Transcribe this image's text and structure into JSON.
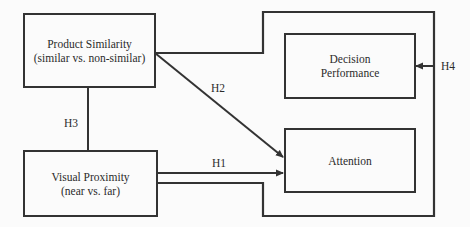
{
  "diagram": {
    "type": "research-model",
    "colors": {
      "line": "#333333",
      "text": "#2b2b2b",
      "background": "#fbfbfb"
    },
    "nodes": {
      "product_similarity": {
        "title": "Product Similarity",
        "subtitle": "(similar vs. non-similar)"
      },
      "visual_proximity": {
        "title": "Visual Proximity",
        "subtitle": "(near vs. far)"
      },
      "decision_performance": {
        "line1": "Decision",
        "line2": "Performance"
      },
      "attention": {
        "title": "Attention"
      }
    },
    "hypotheses": {
      "h1": "H1",
      "h2": "H2",
      "h3": "H3",
      "h4": "H4"
    },
    "edges": [
      {
        "id": "H1",
        "from": "Visual Proximity",
        "to": "Attention",
        "type": "arrow"
      },
      {
        "id": "H2",
        "from": "Product Similarity",
        "to": "Attention",
        "type": "arrow"
      },
      {
        "id": "H3",
        "from": "Product Similarity",
        "to": "Visual Proximity",
        "type": "interaction-line"
      },
      {
        "id": "H4",
        "from": "Product Similarity × Visual Proximity (frame)",
        "to": "Decision Performance",
        "type": "arrow"
      }
    ]
  }
}
